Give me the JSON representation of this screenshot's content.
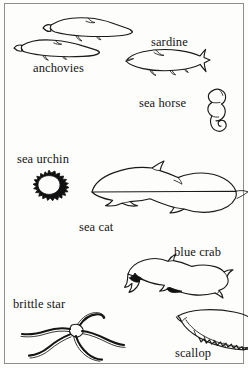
{
  "plate": {
    "title": "Sea creatures line drawings plate",
    "background_color": "#fdfdfb",
    "ink_color": "#1a1a1a",
    "border_color": "#8f8f8a"
  },
  "labels": [
    {
      "id": "anchovies",
      "text": "anchovies",
      "x": 33,
      "y": 62
    },
    {
      "id": "sardine",
      "text": "sardine",
      "x": 151,
      "y": 36
    },
    {
      "id": "sea-horse",
      "text": "sea horse",
      "x": 139,
      "y": 97
    },
    {
      "id": "sea-urchin",
      "text": "sea urchin",
      "x": 17,
      "y": 153
    },
    {
      "id": "sea-cat",
      "text": "sea cat",
      "x": 79,
      "y": 221
    },
    {
      "id": "blue-crab",
      "text": "blue crab",
      "x": 174,
      "y": 246
    },
    {
      "id": "brittle-star",
      "text": "brittle star",
      "x": 13,
      "y": 298
    },
    {
      "id": "scallop",
      "text": "scallop",
      "x": 175,
      "y": 347
    }
  ],
  "figures": [
    {
      "id": "anchovy-upper",
      "name": "anchovy fish upper",
      "x": 40,
      "y": 14
    },
    {
      "id": "anchovy-lower",
      "name": "anchovy fish lower",
      "x": 12,
      "y": 37
    },
    {
      "id": "sardine",
      "name": "sardine fish",
      "x": 122,
      "y": 44
    },
    {
      "id": "sea-horse",
      "name": "sea horse",
      "x": 200,
      "y": 86
    },
    {
      "id": "sea-urchin",
      "name": "sea urchin",
      "x": 22,
      "y": 168
    },
    {
      "id": "sea-cat",
      "name": "sea cat catfish",
      "x": 86,
      "y": 160
    },
    {
      "id": "blue-crab",
      "name": "blue crab",
      "x": 118,
      "y": 250
    },
    {
      "id": "brittle-star",
      "name": "brittle star",
      "x": 14,
      "y": 305
    },
    {
      "id": "scallop",
      "name": "scallop shell",
      "x": 174,
      "y": 308
    }
  ]
}
